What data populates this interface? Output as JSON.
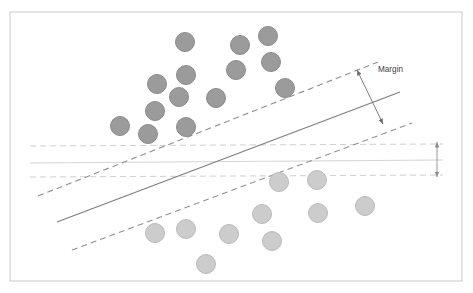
{
  "figure": {
    "background_color": "#ffffff",
    "frame": {
      "name": "outer-frame",
      "x": 10,
      "y": 12,
      "width": 452,
      "height": 269,
      "stroke": "#c9c9c9",
      "stroke_width": 1
    }
  },
  "annotations": {
    "margin_label": "Margin"
  },
  "chart_data": {
    "type": "scatter",
    "xlabel": "",
    "ylabel": "",
    "xlim": [
      0,
      473
    ],
    "ylim": [
      293,
      0
    ],
    "grid": false,
    "legend": "none",
    "axis_ticks": [],
    "annotations": [
      {
        "name": "margin-label",
        "text": "Margin",
        "x": 378,
        "y": 72,
        "color": "#3f3f3f",
        "font_size": 8.2
      }
    ],
    "series": [
      {
        "name": "class-above-hyperplane",
        "marker": "circle",
        "radius": 9.5,
        "fill": "#9b9b9b",
        "stroke": "#8a8a8a",
        "count": 14,
        "points": [
          {
            "x": 185,
            "y": 42
          },
          {
            "x": 240,
            "y": 45
          },
          {
            "x": 268,
            "y": 36
          },
          {
            "x": 236,
            "y": 70
          },
          {
            "x": 271,
            "y": 62
          },
          {
            "x": 186,
            "y": 75
          },
          {
            "x": 157,
            "y": 84
          },
          {
            "x": 285,
            "y": 88
          },
          {
            "x": 179,
            "y": 97
          },
          {
            "x": 216,
            "y": 98
          },
          {
            "x": 155,
            "y": 111
          },
          {
            "x": 120,
            "y": 126
          },
          {
            "x": 148,
            "y": 134
          },
          {
            "x": 186,
            "y": 127
          }
        ]
      },
      {
        "name": "class-below-hyperplane",
        "marker": "circle",
        "radius": 9.5,
        "fill": "#cccccc",
        "stroke": "#bbbbbb",
        "count": 10,
        "points": [
          {
            "x": 279,
            "y": 182
          },
          {
            "x": 317,
            "y": 180
          },
          {
            "x": 365,
            "y": 206
          },
          {
            "x": 262,
            "y": 214
          },
          {
            "x": 318,
            "y": 213
          },
          {
            "x": 186,
            "y": 229
          },
          {
            "x": 155,
            "y": 233
          },
          {
            "x": 229,
            "y": 234
          },
          {
            "x": 272,
            "y": 241
          },
          {
            "x": 206,
            "y": 264
          }
        ]
      }
    ],
    "lines": [
      {
        "name": "decision-boundary-hyperplane",
        "style": "solid",
        "stroke": "#7b7b8a",
        "stroke_width": 1.1,
        "x1": 57,
        "y1": 222,
        "x2": 400,
        "y2": 92
      },
      {
        "name": "upper-margin-boundary",
        "style": "dashed",
        "stroke": "#8e8e9b",
        "stroke_width": 1.1,
        "dash": "6 4",
        "x1": 38,
        "y1": 196,
        "x2": 378,
        "y2": 62
      },
      {
        "name": "lower-margin-boundary",
        "style": "dashed",
        "stroke": "#8e8e9b",
        "stroke_width": 1.1,
        "dash": "6 4",
        "x1": 72,
        "y1": 250,
        "x2": 412,
        "y2": 123
      },
      {
        "name": "horizontal-upper-dashed-line",
        "style": "dashed",
        "stroke": "#cfcfd6",
        "stroke_width": 1,
        "dash": "6 4",
        "x1": 30,
        "y1": 146,
        "x2": 443,
        "y2": 144
      },
      {
        "name": "horizontal-center-solid-line",
        "style": "solid",
        "stroke": "#d4d4da",
        "stroke_width": 1,
        "x1": 30,
        "y1": 163,
        "x2": 443,
        "y2": 160
      },
      {
        "name": "horizontal-lower-dashed-line",
        "style": "dashed",
        "stroke": "#cfcfd6",
        "stroke_width": 1,
        "dash": "6 4",
        "x1": 30,
        "y1": 177,
        "x2": 443,
        "y2": 175
      }
    ],
    "arrows": [
      {
        "name": "margin-measure-arrow",
        "double_headed": true,
        "stroke": "#6f6f7c",
        "stroke_width": 0.9,
        "x1": 357,
        "y1": 70,
        "x2": 383,
        "y2": 124
      },
      {
        "name": "small-gap-arrow",
        "double_headed": true,
        "stroke": "#8d8d96",
        "stroke_width": 0.9,
        "x1": 437,
        "y1": 142,
        "x2": 437,
        "y2": 177
      }
    ]
  }
}
